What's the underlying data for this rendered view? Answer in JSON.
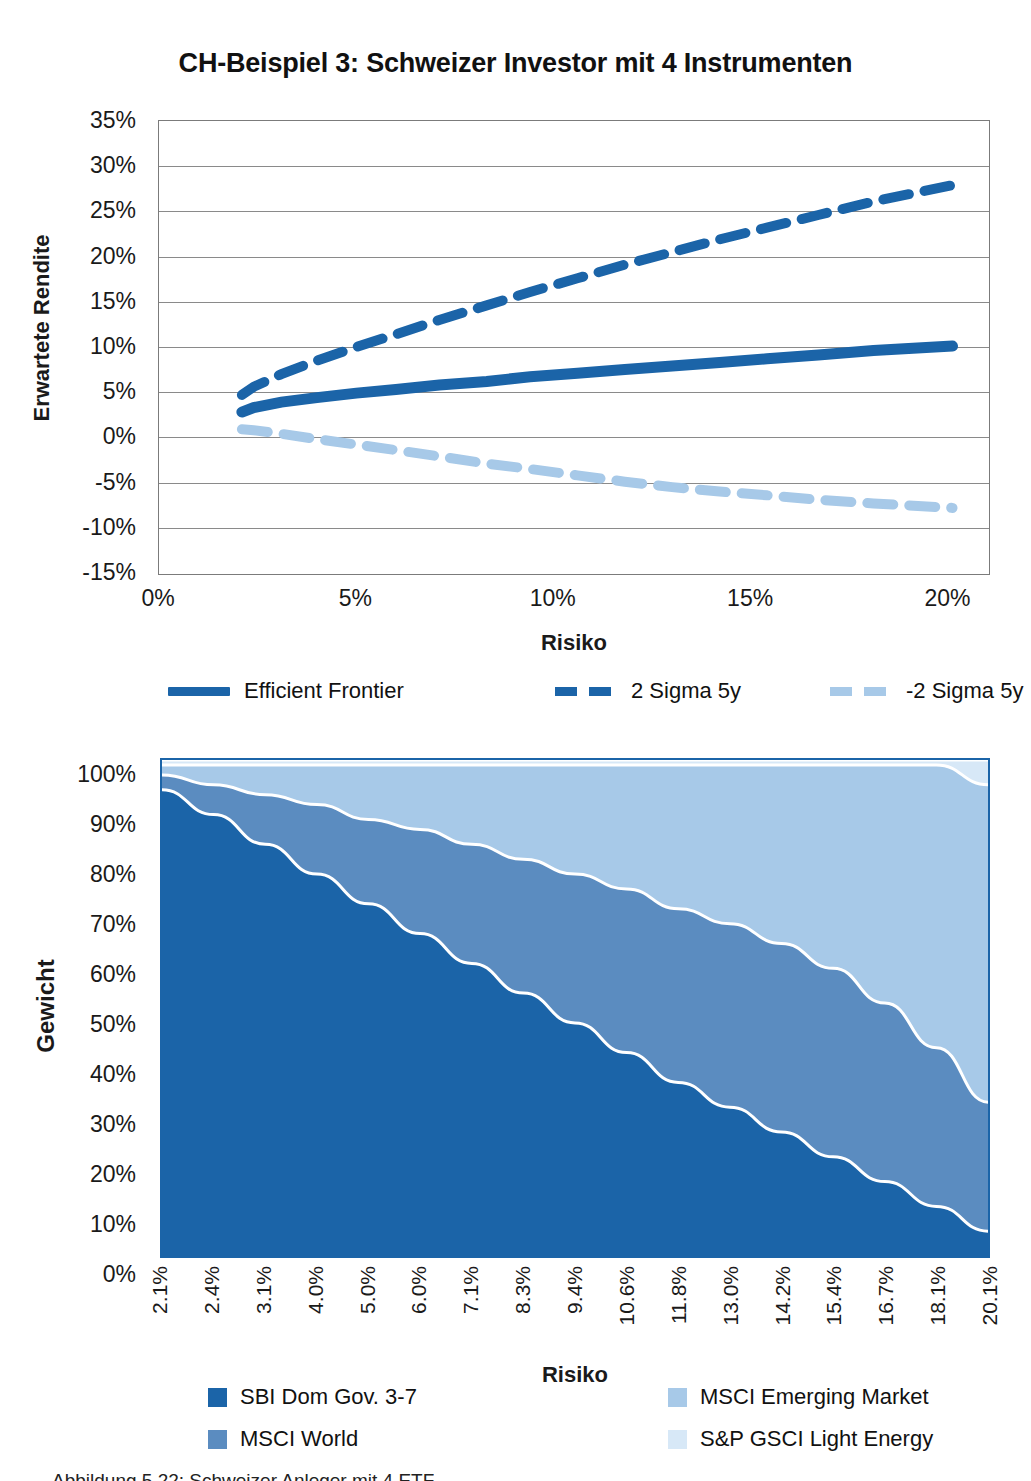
{
  "figure": {
    "title": "CH-Beispiel 3: Schweizer Investor mit 4 Instrumenten",
    "caption": "Abbildung 5.22: Schweizer Anleger mit 4 ETF"
  },
  "colors": {
    "dark_blue": "#1b64a8",
    "mid_blue": "#5b8cc0",
    "light_blue": "#a7c9e8",
    "pale_blue": "#d7e8f7",
    "grid": "#8a8a8a",
    "frame": "#7b7b7b"
  },
  "frontier_chart": {
    "ylabel": "Erwartete Rendite",
    "xlabel": "Risiko",
    "ylabels": [
      "35%",
      "30%",
      "25%",
      "20%",
      "15%",
      "10%",
      "5%",
      "0%",
      "-5%",
      "-10%",
      "-15%"
    ],
    "xlabels": [
      "0%",
      "5%",
      "10%",
      "15%",
      "20%"
    ],
    "legend": [
      {
        "label": "Efficient Frontier",
        "style": "solid",
        "color": "#1b64a8"
      },
      {
        "label": "2 Sigma 5y",
        "style": "dashed",
        "color": "#1b64a8"
      },
      {
        "label": "-2 Sigma 5y",
        "style": "dashed",
        "color": "#a7c9e8"
      }
    ]
  },
  "weights_chart": {
    "ylabel": "Gewicht",
    "xlabel": "Risiko",
    "ylabels": [
      "100%",
      "90%",
      "80%",
      "70%",
      "60%",
      "50%",
      "40%",
      "30%",
      "20%",
      "10%",
      "0%"
    ],
    "xlabels": [
      "2.1%",
      "2.4%",
      "3.1%",
      "4.0%",
      "5.0%",
      "6.0%",
      "7.1%",
      "8.3%",
      "9.4%",
      "10.6%",
      "11.8%",
      "13.0%",
      "14.2%",
      "15.4%",
      "16.7%",
      "18.1%",
      "20.1%"
    ],
    "legend": [
      {
        "label": "SBI Dom Gov. 3-7",
        "color": "#1b64a8"
      },
      {
        "label": "MSCI World",
        "color": "#5b8cc0"
      },
      {
        "label": "MSCI Emerging Market",
        "color": "#a7c9e8"
      },
      {
        "label": "S&P GSCI Light Energy",
        "color": "#d7e8f7"
      }
    ]
  },
  "chart_data": [
    {
      "type": "line",
      "title": "CH-Beispiel 3: Schweizer Investor mit 4 Instrumenten",
      "xlabel": "Risiko",
      "ylabel": "Erwartete Rendite",
      "xlim": [
        0,
        21
      ],
      "ylim": [
        -15,
        35
      ],
      "xticks": [
        0,
        5,
        10,
        15,
        20
      ],
      "yticks": [
        -15,
        -10,
        -5,
        0,
        5,
        10,
        15,
        20,
        25,
        30,
        35
      ],
      "grid": true,
      "legend_position": "below",
      "x": [
        2.1,
        2.4,
        3.1,
        4.0,
        5.0,
        6.0,
        7.1,
        8.3,
        9.4,
        10.6,
        11.8,
        13.0,
        14.2,
        15.4,
        16.7,
        18.1,
        20.1
      ],
      "series": [
        {
          "name": "Efficient Frontier",
          "style": "solid",
          "color": "#1b64a8",
          "values": [
            2.8,
            3.3,
            3.9,
            4.4,
            4.9,
            5.3,
            5.8,
            6.2,
            6.7,
            7.1,
            7.5,
            7.9,
            8.3,
            8.7,
            9.1,
            9.6,
            10.1
          ]
        },
        {
          "name": "2 Sigma 5y",
          "style": "dashed",
          "color": "#1b64a8",
          "values": [
            4.7,
            5.6,
            7.0,
            8.5,
            10.0,
            11.4,
            13.0,
            14.6,
            16.1,
            17.6,
            19.1,
            20.5,
            21.9,
            23.2,
            24.6,
            26.1,
            27.9
          ]
        },
        {
          "name": "-2 Sigma 5y",
          "style": "dashed",
          "color": "#a7c9e8",
          "values": [
            0.9,
            0.8,
            0.4,
            -0.2,
            -0.8,
            -1.4,
            -2.1,
            -2.9,
            -3.5,
            -4.2,
            -4.9,
            -5.5,
            -6.0,
            -6.4,
            -6.9,
            -7.3,
            -7.8
          ]
        }
      ]
    },
    {
      "type": "area",
      "stacked": true,
      "xlabel": "Risiko",
      "ylabel": "Gewicht",
      "ylim": [
        0,
        100
      ],
      "yticks": [
        0,
        10,
        20,
        30,
        40,
        50,
        60,
        70,
        80,
        90,
        100
      ],
      "grid": false,
      "legend_position": "below",
      "categories": [
        "2.1%",
        "2.4%",
        "3.1%",
        "4.0%",
        "5.0%",
        "6.0%",
        "7.1%",
        "8.3%",
        "9.4%",
        "10.6%",
        "11.8%",
        "13.0%",
        "14.2%",
        "15.4%",
        "16.7%",
        "18.1%",
        "20.1%"
      ],
      "series": [
        {
          "name": "SBI Dom Gov. 3-7",
          "color": "#1b64a8",
          "values": [
            94,
            89,
            83,
            77,
            71,
            65,
            59,
            53,
            47,
            41,
            35,
            30,
            25,
            20,
            15,
            10,
            5
          ]
        },
        {
          "name": "MSCI World",
          "color": "#5b8cc0",
          "values": [
            3,
            6,
            10,
            14,
            17,
            21,
            24,
            27,
            30,
            33,
            35,
            37,
            38,
            38,
            36,
            32,
            26
          ]
        },
        {
          "name": "MSCI Emerging Market",
          "color": "#a7c9e8",
          "values": [
            2,
            4,
            6,
            8,
            11,
            13,
            16,
            19,
            22,
            25,
            29,
            32,
            36,
            41,
            48,
            57,
            64
          ]
        },
        {
          "name": "S&P GSCI Light Energy",
          "color": "#d7e8f7",
          "values": [
            1,
            1,
            1,
            1,
            1,
            1,
            1,
            1,
            1,
            1,
            1,
            1,
            1,
            1,
            1,
            1,
            5
          ]
        }
      ]
    }
  ]
}
